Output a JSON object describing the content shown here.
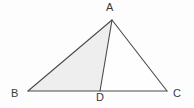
{
  "figure": {
    "background_color": "#fdfdfd",
    "stroke_color": "#4a4a4a",
    "shade_color": "#eeeeee",
    "label_color": "#3a3a3a",
    "labels": {
      "apex": "A",
      "left": "B",
      "right": "C",
      "foot": "D"
    },
    "points": {
      "A": {
        "x": 112,
        "y": 20
      },
      "B": {
        "x": 28,
        "y": 91
      },
      "C": {
        "x": 167,
        "y": 91
      },
      "D": {
        "x": 100,
        "y": 91
      }
    },
    "segments": [
      {
        "name": "AB",
        "from": "A",
        "to": "B"
      },
      {
        "name": "BC",
        "from": "B",
        "to": "C"
      },
      {
        "name": "CA",
        "from": "C",
        "to": "A"
      },
      {
        "name": "AD",
        "from": "A",
        "to": "D"
      }
    ],
    "shaded_region": {
      "name": "ABD",
      "vertices": [
        "A",
        "B",
        "D"
      ]
    },
    "unshaded_region": {
      "name": "ADC",
      "vertices": [
        "A",
        "D",
        "C"
      ]
    }
  }
}
